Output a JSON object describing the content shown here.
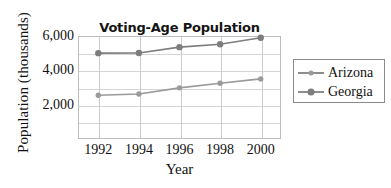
{
  "chart_data": {
    "type": "line",
    "title": "Voting-Age Population",
    "xlabel": "Year",
    "ylabel": "Population (thousands)",
    "x": [
      1992,
      1994,
      1996,
      1998,
      2000
    ],
    "xtick_labels": [
      "1992",
      "1994",
      "1996",
      "1998",
      "2000"
    ],
    "ytick_labels": [
      "2,000",
      "4,000",
      "6,000"
    ],
    "ytick_values": [
      2000,
      4000,
      6000
    ],
    "ylim": [
      0,
      6000
    ],
    "xlim": [
      1991,
      2001
    ],
    "grid": "both",
    "legend_position": "right-outside",
    "series": [
      {
        "name": "Arizona",
        "color": "#9a9a9a",
        "marker": "circle-small",
        "values": [
          2550,
          2620,
          2980,
          3250,
          3500
        ]
      },
      {
        "name": "Georgia",
        "color": "#7d7d7d",
        "marker": "circle-large",
        "values": [
          5000,
          5010,
          5350,
          5520,
          5900
        ]
      }
    ]
  },
  "legend": {
    "items": [
      {
        "label": "Arizona"
      },
      {
        "label": "Georgia"
      }
    ]
  }
}
